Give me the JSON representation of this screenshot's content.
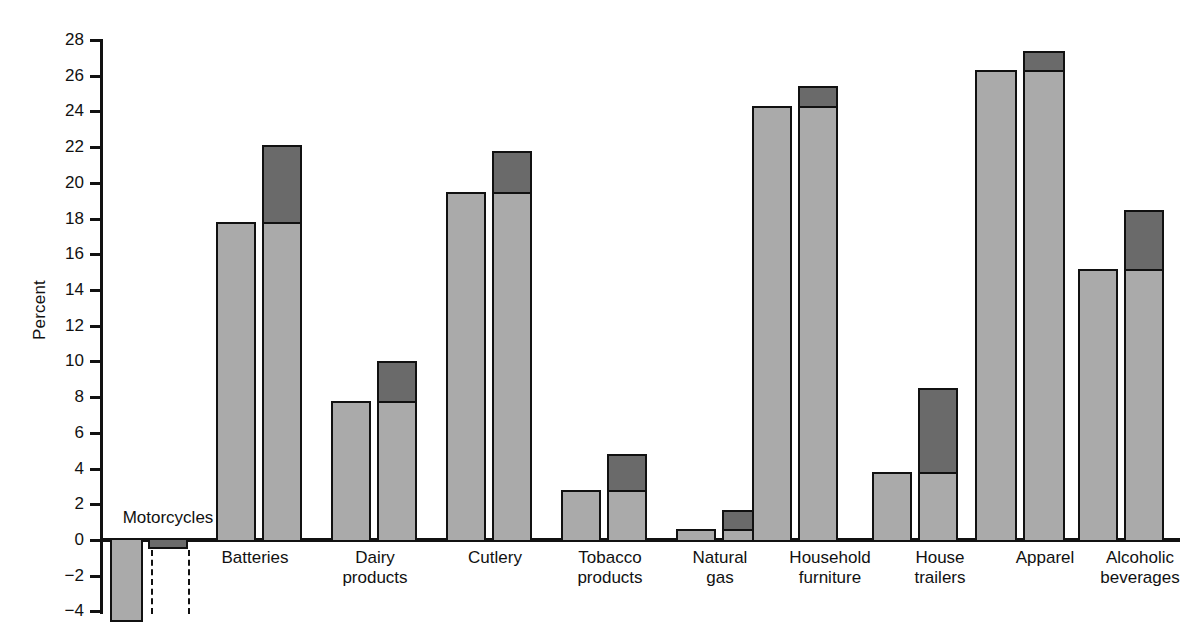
{
  "chart_data": {
    "type": "bar",
    "title": "",
    "subtitle": "",
    "xlabel": "",
    "ylabel": "Percent",
    "ylim": [
      -4,
      28
    ],
    "ytick_step": 2,
    "yticks": [
      "28",
      "26",
      "24",
      "22",
      "20",
      "18",
      "16",
      "14",
      "12",
      "10",
      "8",
      "6",
      "4",
      "2",
      "0",
      "-2",
      "-4"
    ],
    "grid": false,
    "legend_position": "none",
    "colors": {
      "light_series": "#aaaaaa",
      "dark_series": "#6a6a6a",
      "outline": "#111111",
      "background": "#ffffff"
    },
    "categories": [
      "Motorcycles",
      "Batteries",
      "Dairy\nproducts",
      "Cutlery",
      "Tobacco\nproducts",
      "Natural\ngas",
      "Household\nfurniture",
      "House\ntrailers",
      "Apparel",
      "Alcoholic\nbeverages"
    ],
    "series": [
      {
        "name": "light",
        "values": [
          -4.6,
          17.8,
          7.8,
          19.5,
          2.8,
          0.6,
          24.3,
          3.8,
          26.3,
          15.2
        ]
      },
      {
        "name": "dark",
        "values": [
          -0.5,
          22.1,
          10.0,
          21.8,
          4.8,
          1.7,
          25.4,
          8.5,
          27.4,
          18.5
        ]
      }
    ],
    "notes": {
      "first_bar_clipped": "Motorcycles light bar extends below the visible -4 axis limit",
      "dashed_marker": "Motorcycles second bar has dashed vertical leader lines below the axis"
    }
  }
}
